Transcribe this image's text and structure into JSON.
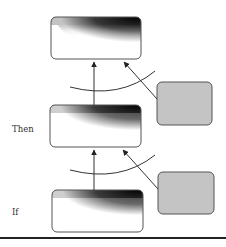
{
  "diagram": {
    "labels": {
      "then": "Then",
      "if": "If"
    },
    "nodes": [
      {
        "id": "top-box",
        "kind": "gradient",
        "level": "top"
      },
      {
        "id": "then-box",
        "kind": "gradient",
        "level": "then"
      },
      {
        "id": "if-box",
        "kind": "gradient",
        "level": "if"
      },
      {
        "id": "upper-side-box",
        "kind": "gray"
      },
      {
        "id": "lower-side-box",
        "kind": "gray"
      }
    ],
    "edges": [
      {
        "from": "if-box",
        "to": "then-box",
        "type": "arrow"
      },
      {
        "from": "then-box",
        "to": "top-box",
        "type": "arrow"
      },
      {
        "from": "lower-side-box",
        "to": "then-box",
        "type": "arrow"
      },
      {
        "from": "upper-side-box",
        "to": "top-box",
        "type": "arrow"
      }
    ],
    "colors": {
      "box_border": "#555555",
      "gradient_dark": "#111111",
      "gradient_light": "#ffffff",
      "side_box_fill": "#c4c4c4",
      "arrow": "#222222",
      "rule": "#222222"
    }
  }
}
